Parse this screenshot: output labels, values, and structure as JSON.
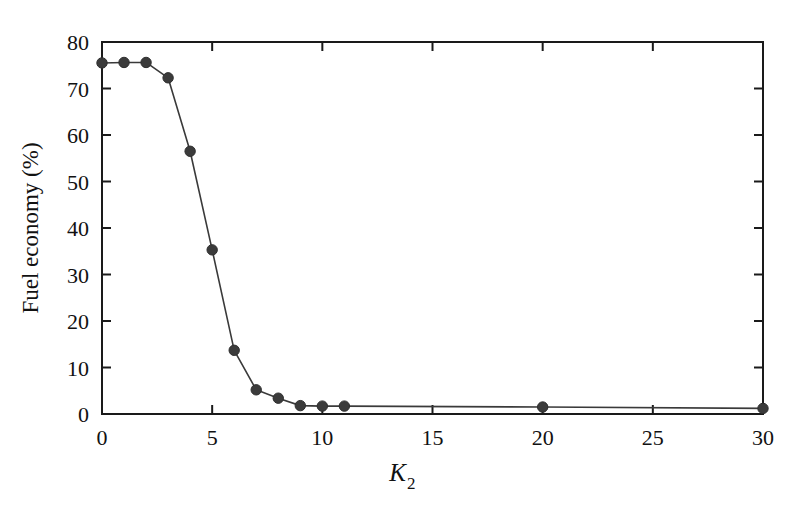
{
  "chart_data": {
    "type": "line",
    "title": "",
    "subtitle": "",
    "xlabel": "K_2",
    "xlabel_base": "K",
    "xlabel_sub": "2",
    "ylabel": "Fuel economy (%)",
    "xlim": [
      0,
      30
    ],
    "ylim": [
      0,
      80
    ],
    "xticks": [
      0,
      5,
      10,
      15,
      20,
      25,
      30
    ],
    "xticklabels": [
      "0",
      "5",
      "10",
      "15",
      "20",
      "25",
      "30"
    ],
    "yticks": [
      0,
      10,
      20,
      30,
      40,
      50,
      60,
      70,
      80
    ],
    "yticklabels": [
      "0",
      "10",
      "20",
      "30",
      "40",
      "50",
      "60",
      "70",
      "80"
    ],
    "grid": false,
    "legend": null,
    "legend_position": "none",
    "marker": "circle",
    "line_color": "#3a3a3a",
    "marker_color": "#3b3b3b",
    "background_color": "#ffffff",
    "frame_color": "#1a1a1a",
    "series": [
      {
        "name": "Fuel economy",
        "x": [
          0,
          1,
          2,
          3,
          4,
          5,
          6,
          7,
          8,
          9,
          10,
          11,
          20,
          30
        ],
        "values": [
          75.5,
          75.6,
          75.6,
          72.3,
          56.5,
          35.3,
          13.7,
          5.2,
          3.4,
          1.8,
          1.7,
          1.7,
          1.5,
          1.2
        ]
      }
    ]
  }
}
